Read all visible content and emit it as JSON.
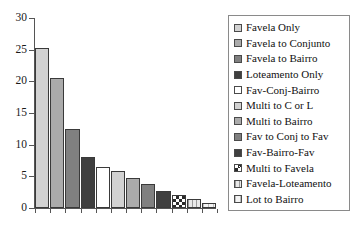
{
  "chart_data": {
    "type": "bar",
    "title": "",
    "xlabel": "",
    "ylabel": "",
    "ylim": [
      0,
      30
    ],
    "yticks": [
      0,
      5,
      10,
      15,
      20,
      25,
      30
    ],
    "ytick_labels": [
      "0",
      "5",
      "10",
      "15",
      "20",
      "25",
      "30"
    ],
    "grid": false,
    "legend_position": "right",
    "x_tick_labels_visible": false,
    "categories": [
      "Favela Only",
      "Favela to Conjunto",
      "Favela to Bairro",
      "Loteamento Only",
      "Fav-Conj-Bairro",
      "Multi to C or L",
      "Multi to Bairro",
      "Fav to Conj to Fav",
      "Fav-Bairro-Fav",
      "Multi to Favela",
      "Favela-Loteamento",
      "Lot to Bairro"
    ],
    "values": [
      25.3,
      20.5,
      12.4,
      8.1,
      6.4,
      5.8,
      4.8,
      3.8,
      2.7,
      2.0,
      1.5,
      0.8
    ],
    "fills": [
      "light-gray",
      "medium-gray",
      "dark-gray",
      "very-dark-gray",
      "white",
      "light-gray",
      "medium-gray",
      "dark-gray",
      "very-dark-gray",
      "checkerboard",
      "vertical-stripe",
      "faint-stripe"
    ],
    "colors": {
      "light-gray": "#d2d2d2",
      "medium-gray": "#ababab",
      "dark-gray": "#808080",
      "very-dark-gray": "#3f3f3f",
      "white": "#ffffff",
      "checkerboard": "#2b2b2b",
      "vertical-stripe": "#9a9a9a",
      "faint-stripe": "#bdbdbd",
      "axis": "#555555",
      "bar-outline": "#3a3a3a",
      "legend-border": "#8a8a8a"
    }
  },
  "legend": {
    "items": [
      {
        "label": "Favela Only",
        "fill": "light-gray"
      },
      {
        "label": "Favela to Conjunto",
        "fill": "medium-gray"
      },
      {
        "label": "Favela to Bairro",
        "fill": "dark-gray"
      },
      {
        "label": "Loteamento Only",
        "fill": "very-dark-gray"
      },
      {
        "label": "Fav-Conj-Bairro",
        "fill": "white"
      },
      {
        "label": "Multi to C or L",
        "fill": "light-gray"
      },
      {
        "label": "Multi to Bairro",
        "fill": "medium-gray"
      },
      {
        "label": "Fav to Conj to Fav",
        "fill": "dark-gray"
      },
      {
        "label": "Fav-Bairro-Fav",
        "fill": "very-dark-gray"
      },
      {
        "label": "Multi to Favela",
        "fill": "checkerboard"
      },
      {
        "label": "Favela-Loteamento",
        "fill": "vertical-stripe"
      },
      {
        "label": "Lot to Bairro",
        "fill": "faint-stripe"
      }
    ]
  }
}
